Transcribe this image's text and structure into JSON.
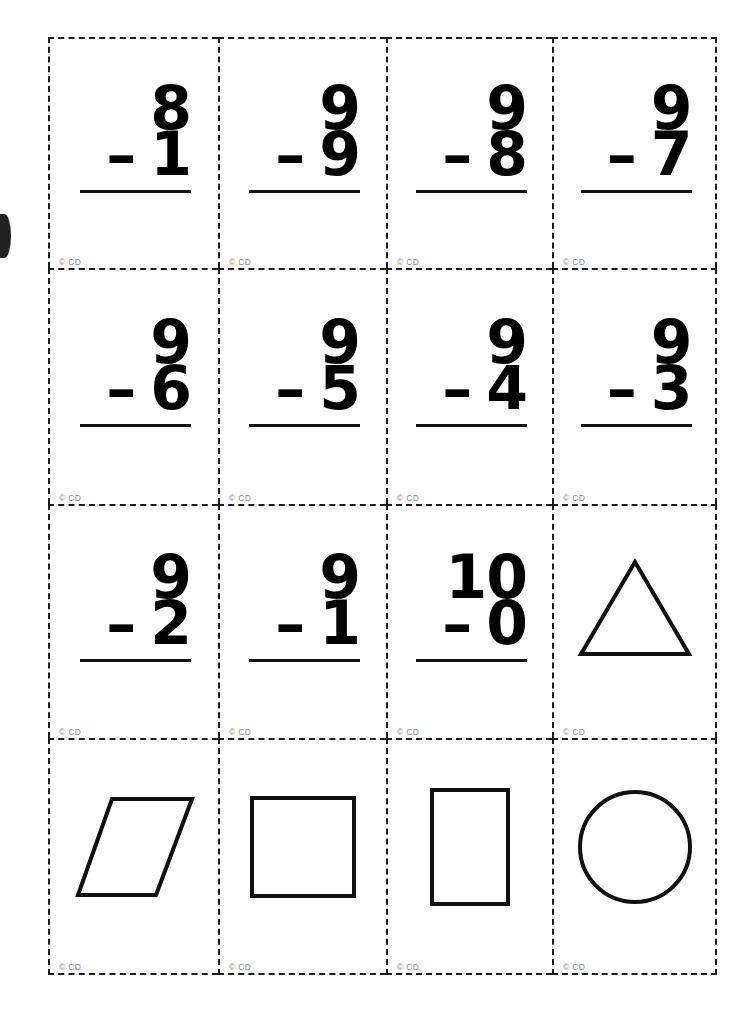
{
  "page": {
    "copyright_mark": "© CD",
    "line_color": "#101010",
    "cut_guide_color": "#1b1b1b",
    "copyright_color": "#8a8a8a",
    "background_color": "#ffffff",
    "columns": 4,
    "rows": 4
  },
  "cards": [
    {
      "type": "subtraction",
      "minuend": "8",
      "operator": "–",
      "subtrahend": "1",
      "copyright": "© CD"
    },
    {
      "type": "subtraction",
      "minuend": "9",
      "operator": "–",
      "subtrahend": "9",
      "copyright": "© CD"
    },
    {
      "type": "subtraction",
      "minuend": "9",
      "operator": "–",
      "subtrahend": "8",
      "copyright": "© CD"
    },
    {
      "type": "subtraction",
      "minuend": "9",
      "operator": "–",
      "subtrahend": "7",
      "copyright": "© CD"
    },
    {
      "type": "subtraction",
      "minuend": "9",
      "operator": "–",
      "subtrahend": "6",
      "copyright": "© CD"
    },
    {
      "type": "subtraction",
      "minuend": "9",
      "operator": "–",
      "subtrahend": "5",
      "copyright": "© CD"
    },
    {
      "type": "subtraction",
      "minuend": "9",
      "operator": "–",
      "subtrahend": "4",
      "copyright": "© CD"
    },
    {
      "type": "subtraction",
      "minuend": "9",
      "operator": "–",
      "subtrahend": "3",
      "copyright": "© CD"
    },
    {
      "type": "subtraction",
      "minuend": "9",
      "operator": "–",
      "subtrahend": "2",
      "copyright": "© CD"
    },
    {
      "type": "subtraction",
      "minuend": "9",
      "operator": "–",
      "subtrahend": "1",
      "copyright": "© CD"
    },
    {
      "type": "subtraction",
      "minuend": "10",
      "operator": "–",
      "subtrahend": "0",
      "copyright": "© CD"
    },
    {
      "type": "shape",
      "shape": "triangle",
      "copyright": "© CD"
    },
    {
      "type": "shape",
      "shape": "parallelogram",
      "copyright": "© CD"
    },
    {
      "type": "shape",
      "shape": "square",
      "copyright": "© CD"
    },
    {
      "type": "shape",
      "shape": "rectangle",
      "copyright": "© CD"
    },
    {
      "type": "shape",
      "shape": "circle",
      "copyright": "© CD"
    }
  ]
}
